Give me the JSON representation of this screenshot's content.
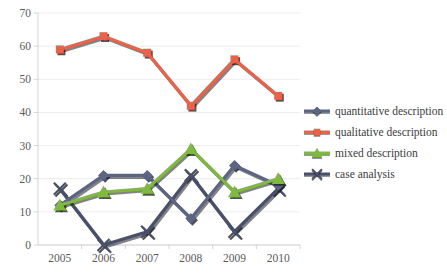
{
  "chart_data": {
    "type": "line",
    "title": "",
    "xlabel": "",
    "ylabel": "",
    "categories": [
      "2005",
      "2006",
      "2007",
      "2008",
      "2009",
      "2010"
    ],
    "x": [
      2005,
      2006,
      2007,
      2008,
      2009,
      2010
    ],
    "ylim": [
      0,
      70
    ],
    "ytick_values": [
      0,
      10,
      20,
      30,
      40,
      50,
      60,
      70
    ],
    "ytick_labels": [
      "0",
      "10",
      "20",
      "30",
      "40",
      "50",
      "60",
      "70"
    ],
    "grid": true,
    "legend_position": "right",
    "series": [
      {
        "name": "quantitative description",
        "values": [
          12,
          21,
          21,
          8,
          24,
          18
        ],
        "color": "#5b6584",
        "marker": "diamond"
      },
      {
        "name": "qualitative description",
        "values": [
          59,
          63,
          58,
          42,
          56,
          45
        ],
        "color": "#e8634a",
        "marker": "square"
      },
      {
        "name": "mixed description",
        "values": [
          12,
          16,
          17,
          29,
          16,
          20
        ],
        "color": "#7fb942",
        "marker": "triangle"
      },
      {
        "name": "case analysis",
        "values": [
          17,
          0,
          4,
          21,
          4,
          17
        ],
        "color": "#49506b",
        "marker": "x"
      }
    ]
  },
  "legend": {
    "items": [
      {
        "label": "quantitative description",
        "color": "#5b6584",
        "marker": "diamond"
      },
      {
        "label": "qualitative description",
        "color": "#e8634a",
        "marker": "square"
      },
      {
        "label": "mixed description",
        "color": "#7fb942",
        "marker": "triangle"
      },
      {
        "label": "case analysis",
        "color": "#49506b",
        "marker": "x"
      }
    ]
  },
  "axes": {
    "gridline_color": "#ededed",
    "axis_color": "#d4d4d4",
    "tick_text_color": "#5a5a5a"
  }
}
